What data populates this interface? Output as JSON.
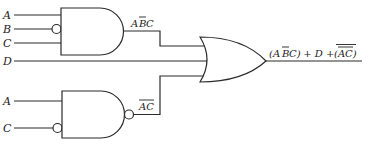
{
  "diagram": {
    "type": "logic-circuit",
    "inputs": {
      "top_gate": [
        "A",
        "B",
        "C"
      ],
      "direct": "D",
      "bottom_gate": [
        "A",
        "C"
      ]
    },
    "gates": [
      {
        "id": "and1",
        "type": "AND",
        "inverted_inputs": [
          "B"
        ],
        "output_label": "ABC",
        "output_label_overbar": "B"
      },
      {
        "id": "nand1",
        "type": "NAND",
        "inverted_inputs": [
          "C"
        ],
        "output_label": "AC",
        "output_label_overbar": "AC"
      },
      {
        "id": "or1",
        "type": "OR",
        "inputs": [
          "ABC",
          "D",
          "AC"
        ]
      }
    ],
    "labels": {
      "A1": "A",
      "B1": "B",
      "C1": "C",
      "D": "D",
      "A2": "A",
      "C2": "C",
      "and_out_A": "A",
      "and_out_B": "B",
      "and_out_C": "C",
      "nand_out": "AC",
      "expr_open1": "(A",
      "expr_B": "B",
      "expr_C_close": "C)",
      "expr_plus_D": " + D + ",
      "expr_paren_AC": "(AC)"
    },
    "output_expression": "(AB̄C) + D + (ĀC̄)",
    "stroke_color": "#2a2a2a"
  }
}
